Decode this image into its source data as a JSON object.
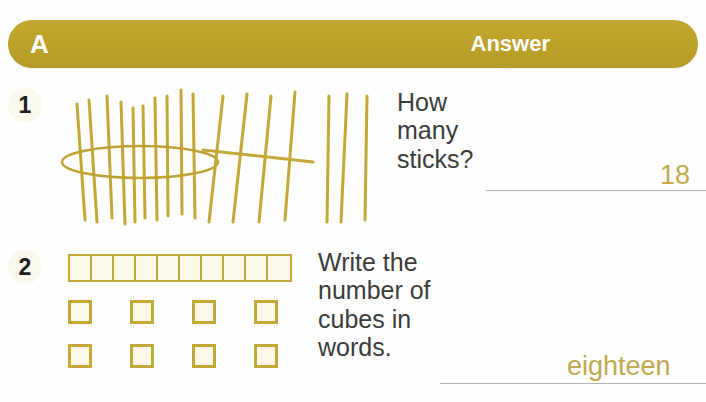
{
  "header": {
    "section_letter": "A",
    "answer_label": "Answer",
    "bar_color": "#bfa22e",
    "text_color": "#ffffff"
  },
  "accent_color": "#c2a836",
  "answer_ink_color": "#c0aa4d",
  "prompt_color": "#3c3c3b",
  "questions": [
    {
      "number": "1",
      "prompt": "How\nmany\nsticks?",
      "answer": "18",
      "illustration": {
        "type": "sticks",
        "bundle_count": 10,
        "tally_group_count": 5,
        "loose_count": 3,
        "total": 18,
        "color": "#c2a836"
      }
    },
    {
      "number": "2",
      "prompt": "Write the\nnumber of\ncubes in\nwords.",
      "answer": "eighteen",
      "illustration": {
        "type": "cubes",
        "rod_cells": 10,
        "loose_rows": 2,
        "loose_per_row": 4,
        "loose_count": 8,
        "total": 18,
        "border_color": "#c2a836",
        "fill_color": "#fbf8ea"
      }
    }
  ]
}
